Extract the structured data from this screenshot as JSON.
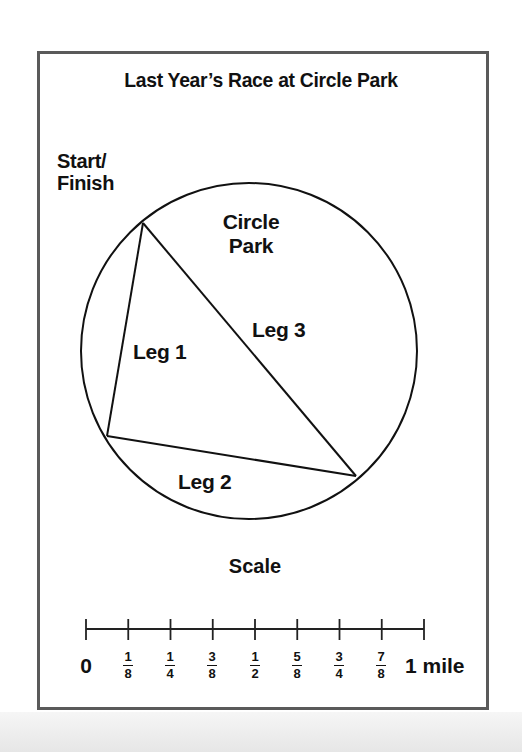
{
  "title": "Last Year’s Race at Circle Park",
  "labels": {
    "start_finish_line1": "Start/",
    "start_finish_line2": "Finish",
    "park_line1": "Circle",
    "park_line2": "Park",
    "leg1": "Leg 1",
    "leg2": "Leg 2",
    "leg3": "Leg 3"
  },
  "scale": {
    "title": "Scale",
    "zero": "0",
    "end": "1 mile",
    "ticks": [
      {
        "num": "1",
        "den": "8"
      },
      {
        "num": "1",
        "den": "4"
      },
      {
        "num": "3",
        "den": "8"
      },
      {
        "num": "1",
        "den": "2"
      },
      {
        "num": "5",
        "den": "8"
      },
      {
        "num": "3",
        "den": "4"
      },
      {
        "num": "7",
        "den": "8"
      }
    ]
  },
  "colors": {
    "line": "#111111",
    "frame": "#5a5a5a"
  }
}
